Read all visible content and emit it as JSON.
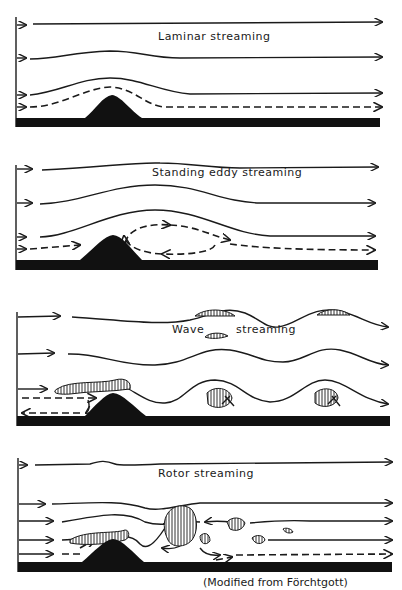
{
  "panels": [
    {
      "id": "laminar",
      "title": "Laminar streaming"
    },
    {
      "id": "standing-eddy",
      "title": "Standing eddy streaming"
    },
    {
      "id": "wave",
      "title_left": "Wave",
      "title_right": "streaming"
    },
    {
      "id": "rotor",
      "title": "Rotor streaming"
    }
  ],
  "caption": "(Modified from Förchtgott)",
  "colors": {
    "ink": "#1a1a1a",
    "background": "#ffffff"
  }
}
